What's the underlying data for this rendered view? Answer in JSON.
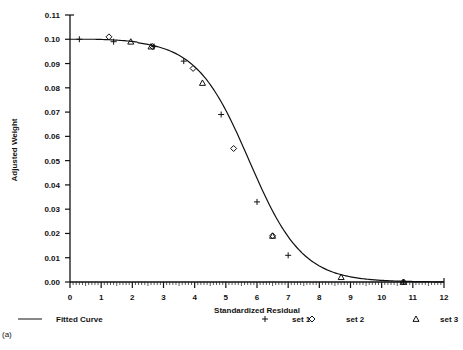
{
  "chart_data": {
    "type": "scatter",
    "title": "",
    "panel_label": "(a)",
    "xlabel": "Standardized Residual",
    "ylabel": "Adjusted Weight",
    "xlim": [
      0,
      12
    ],
    "ylim": [
      0,
      0.11
    ],
    "x_ticks": [
      "0",
      "1",
      "2",
      "3",
      "4",
      "5",
      "6",
      "7",
      "8",
      "9",
      "10",
      "11",
      "12"
    ],
    "y_ticks": [
      "0.00",
      "0.01",
      "0.02",
      "0.03",
      "0.04",
      "0.05",
      "0.06",
      "0.07",
      "0.08",
      "0.09",
      "0.10",
      "0.11"
    ],
    "grid": false,
    "legend_position": "bottom",
    "legend": [
      {
        "label": "Fitted Curve",
        "marker": "line"
      },
      {
        "label": "set 1",
        "marker": "+"
      },
      {
        "label": "set 2",
        "marker": "diamond"
      },
      {
        "label": "set 3",
        "marker": "triangle"
      }
    ],
    "fitted_curve": {
      "name": "Fitted Curve",
      "x": [
        0,
        1,
        2,
        2.5,
        3,
        3.5,
        4,
        4.5,
        5,
        5.5,
        6,
        6.5,
        7,
        7.5,
        8,
        8.5,
        9,
        9.5,
        10,
        11,
        12
      ],
      "y": [
        0.1,
        0.1,
        0.0995,
        0.0985,
        0.096,
        0.092,
        0.085,
        0.076,
        0.064,
        0.051,
        0.038,
        0.026,
        0.016,
        0.009,
        0.0045,
        0.002,
        0.0008,
        0.0003,
        0.0001,
        0.0,
        0.0
      ]
    },
    "series": [
      {
        "name": "set 1",
        "marker": "+",
        "x": [
          0.3,
          1.4,
          2.7,
          3.65,
          4.85,
          6.0,
          7.0,
          10.7
        ],
        "y": [
          0.1,
          0.099,
          0.097,
          0.091,
          0.069,
          0.033,
          0.011,
          0.0
        ]
      },
      {
        "name": "set 2",
        "marker": "diamond",
        "x": [
          1.25,
          2.65,
          3.95,
          5.25,
          6.5,
          10.7
        ],
        "y": [
          0.101,
          0.097,
          0.088,
          0.055,
          0.019,
          0.0
        ]
      },
      {
        "name": "set 3",
        "marker": "triangle",
        "x": [
          1.95,
          2.6,
          4.25,
          6.5,
          8.7,
          10.7
        ],
        "y": [
          0.099,
          0.097,
          0.082,
          0.019,
          0.002,
          0.0
        ]
      }
    ]
  }
}
